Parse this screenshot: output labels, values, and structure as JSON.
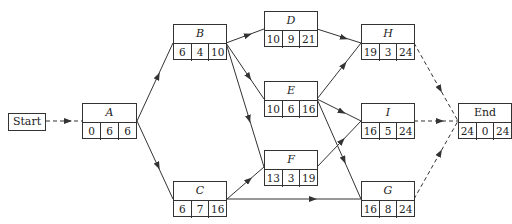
{
  "diagram": {
    "type": "activity-on-node network",
    "start": {
      "label": "Start"
    },
    "nodes": [
      {
        "id": "A",
        "label": "A",
        "values": [
          "0",
          "6",
          "6"
        ]
      },
      {
        "id": "B",
        "label": "B",
        "values": [
          "6",
          "4",
          "10"
        ]
      },
      {
        "id": "C",
        "label": "C",
        "values": [
          "6",
          "7",
          "16"
        ]
      },
      {
        "id": "D",
        "label": "D",
        "values": [
          "10",
          "9",
          "21"
        ]
      },
      {
        "id": "E",
        "label": "E",
        "values": [
          "10",
          "6",
          "16"
        ]
      },
      {
        "id": "F",
        "label": "F",
        "values": [
          "13",
          "3",
          "19"
        ]
      },
      {
        "id": "H",
        "label": "H",
        "values": [
          "19",
          "3",
          "24"
        ]
      },
      {
        "id": "I",
        "label": "I",
        "values": [
          "16",
          "5",
          "24"
        ]
      },
      {
        "id": "G",
        "label": "G",
        "values": [
          "16",
          "8",
          "24"
        ]
      },
      {
        "id": "End",
        "label": "End",
        "values": [
          "24",
          "0",
          "24"
        ]
      }
    ],
    "edges": [
      {
        "from": "Start",
        "to": "A",
        "style": "dashed"
      },
      {
        "from": "A",
        "to": "B",
        "style": "solid"
      },
      {
        "from": "A",
        "to": "C",
        "style": "solid"
      },
      {
        "from": "B",
        "to": "D",
        "style": "solid"
      },
      {
        "from": "B",
        "to": "E",
        "style": "solid"
      },
      {
        "from": "B",
        "to": "F",
        "style": "solid"
      },
      {
        "from": "C",
        "to": "F",
        "style": "solid"
      },
      {
        "from": "C",
        "to": "G",
        "style": "solid"
      },
      {
        "from": "D",
        "to": "H",
        "style": "solid"
      },
      {
        "from": "E",
        "to": "H",
        "style": "solid"
      },
      {
        "from": "E",
        "to": "I",
        "style": "solid"
      },
      {
        "from": "E",
        "to": "G",
        "style": "solid"
      },
      {
        "from": "F",
        "to": "I",
        "style": "solid"
      },
      {
        "from": "H",
        "to": "End",
        "style": "dashed"
      },
      {
        "from": "I",
        "to": "End",
        "style": "dashed"
      },
      {
        "from": "G",
        "to": "End",
        "style": "dashed"
      }
    ],
    "colors": {
      "line": "#333333",
      "background": "#ffffff"
    }
  }
}
